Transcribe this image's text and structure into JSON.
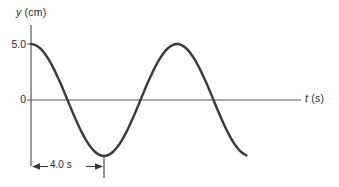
{
  "figure": {
    "axes": {
      "y_axis_label": "y (cm)",
      "y_axis_symbol": "y",
      "y_axis_unit": "(cm)",
      "t_axis_label": "t (s)",
      "t_axis_symbol": "t",
      "t_axis_unit": "(s)"
    },
    "tick_labels": {
      "y_top": "5.0",
      "y_zero": "0"
    },
    "dimension": {
      "label": "4.0 s"
    },
    "colors": {
      "curve": "#3b3b3b",
      "axis": "#555555",
      "text": "#2a2a2a",
      "background": "#ffffff"
    }
  },
  "chart_data": {
    "type": "line",
    "title": "",
    "xlabel": "t (s)",
    "ylabel": "y (cm)",
    "xlim": [
      0,
      11.8
    ],
    "ylim": [
      -5.0,
      5.0
    ],
    "grid": false,
    "legend": null,
    "annotations": [
      {
        "text": "4.0 s",
        "kind": "dimension-arrow",
        "from_x": 0,
        "to_x": 4.0,
        "meaning": "half-period interval from t=0 to first minimum"
      }
    ],
    "y_ticks": [
      {
        "value": 5.0,
        "label": "5.0"
      },
      {
        "value": 0,
        "label": "0"
      }
    ],
    "x_ticks": [],
    "waveform": {
      "shape": "cosine",
      "amplitude_cm": 5.0,
      "period_s": 8.0,
      "phase": 0,
      "equation": "y = 5.0 cos(2*pi*t/8.0)"
    },
    "series": [
      {
        "name": "y(t)",
        "x": [
          0.0,
          0.25,
          0.5,
          0.75,
          1.0,
          1.25,
          1.5,
          1.75,
          2.0,
          2.25,
          2.5,
          2.75,
          3.0,
          3.25,
          3.5,
          3.75,
          4.0,
          4.25,
          4.5,
          4.75,
          5.0,
          5.25,
          5.5,
          5.75,
          6.0,
          6.25,
          6.5,
          6.75,
          7.0,
          7.25,
          7.5,
          7.75,
          8.0,
          8.25,
          8.5,
          8.75,
          9.0,
          9.25,
          9.5,
          9.75,
          10.0,
          10.25,
          10.5,
          10.75,
          11.0,
          11.25,
          11.5,
          11.75,
          11.8
        ],
        "y": [
          5.0,
          4.9,
          4.62,
          4.16,
          3.54,
          2.78,
          1.91,
          0.98,
          0.0,
          -0.98,
          -1.91,
          -2.78,
          -3.54,
          -4.16,
          -4.62,
          -4.9,
          -5.0,
          -4.9,
          -4.62,
          -4.16,
          -3.54,
          -2.78,
          -1.91,
          -0.98,
          0.0,
          0.98,
          1.91,
          2.78,
          3.54,
          4.16,
          4.62,
          4.9,
          5.0,
          4.9,
          4.62,
          4.16,
          3.54,
          2.78,
          1.91,
          0.98,
          0.0,
          -0.98,
          -1.91,
          -2.78,
          -3.54,
          -4.16,
          -4.62,
          -4.9,
          -4.95
        ]
      }
    ]
  }
}
